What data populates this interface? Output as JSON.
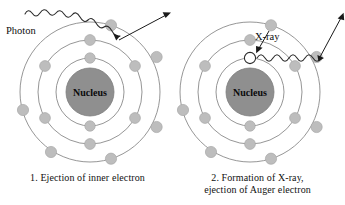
{
  "figure": {
    "background_color": "#ffffff"
  },
  "colors": {
    "orbit_stroke": "#8a8a8a",
    "electron_fill": "#bdbdbd",
    "electron_stroke": "#a8a8a8",
    "nucleus_fill": "#8f8f8f",
    "nucleus_stroke": "#7d7d7d",
    "vacancy_fill": "#ffffff",
    "vacancy_stroke": "#2b2b2b",
    "arrow_color": "#1a1a1a",
    "wave_color": "#2b2b2b",
    "text_color": "#111111"
  },
  "panels": [
    {
      "id": "left",
      "caption_lines": [
        "1. Ejection of inner electron"
      ],
      "nucleus_label": "Nucleus",
      "annotations": [
        {
          "name": "photon-label",
          "text": "Photon"
        }
      ],
      "shells": [
        {
          "name": "inner-shell",
          "radius": 34,
          "electron_count": 2
        },
        {
          "name": "middle-shell",
          "radius": 52,
          "electron_count": 6
        },
        {
          "name": "outer-shell",
          "radius": 70,
          "electron_count": 6
        }
      ],
      "incoming": {
        "type": "photon",
        "label": "Photon",
        "style": "wavy"
      },
      "outgoing": {
        "type": "ejected-electron",
        "style": "straight-arrow"
      }
    },
    {
      "id": "right",
      "caption_lines": [
        "2. Formation of X-ray,",
        "ejection of Auger electron"
      ],
      "nucleus_label": "Nucleus",
      "annotations": [
        {
          "name": "xray-label",
          "text": "X-ray"
        }
      ],
      "shells": [
        {
          "name": "inner-shell",
          "radius": 34,
          "electron_count": 2
        },
        {
          "name": "middle-shell",
          "radius": 52,
          "electron_count": 6
        },
        {
          "name": "outer-shell",
          "radius": 70,
          "electron_count": 6
        }
      ],
      "vacancy": {
        "name": "inner-shell-vacancy",
        "present": true
      },
      "incoming": {
        "type": "relaxing-electron",
        "style": "straight-arrow"
      },
      "emitted": {
        "type": "x-ray-photon",
        "label": "X-ray",
        "style": "wavy"
      },
      "outgoing": {
        "type": "auger-electron",
        "style": "straight-arrow"
      }
    }
  ]
}
